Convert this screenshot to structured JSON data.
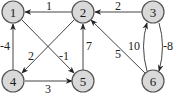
{
  "graph": {
    "type": "directed-weighted",
    "colors": {
      "node_fill": "#d9d9d9",
      "node_stroke": "#555555",
      "edge": "#444444"
    },
    "nodes": [
      {
        "id": "1",
        "label": "1",
        "x": 13,
        "y": 12
      },
      {
        "id": "2",
        "label": "2",
        "x": 83,
        "y": 12
      },
      {
        "id": "3",
        "label": "3",
        "x": 153,
        "y": 12
      },
      {
        "id": "4",
        "label": "4",
        "x": 13,
        "y": 81
      },
      {
        "id": "5",
        "label": "5",
        "x": 83,
        "y": 81
      },
      {
        "id": "6",
        "label": "6",
        "x": 153,
        "y": 81
      }
    ],
    "edges": [
      {
        "from": "2",
        "to": "1",
        "weight": "1"
      },
      {
        "from": "3",
        "to": "2",
        "weight": "2"
      },
      {
        "from": "4",
        "to": "1",
        "weight": "-4"
      },
      {
        "from": "1",
        "to": "5",
        "weight": "-1"
      },
      {
        "from": "2",
        "to": "4",
        "weight": "2"
      },
      {
        "from": "5",
        "to": "2",
        "weight": "7"
      },
      {
        "from": "4",
        "to": "5",
        "weight": "3"
      },
      {
        "from": "6",
        "to": "2",
        "weight": "5"
      },
      {
        "from": "6",
        "to": "3",
        "weight": "10"
      },
      {
        "from": "3",
        "to": "6",
        "weight": "-8"
      }
    ]
  }
}
